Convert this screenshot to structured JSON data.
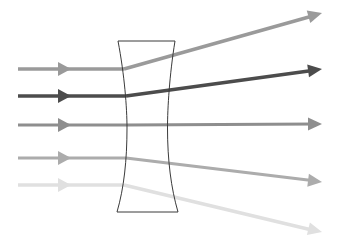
{
  "diagram": {
    "type": "optics-ray-diagram",
    "canvas": {
      "width": 339,
      "height": 251,
      "background": "#ffffff"
    },
    "lens": {
      "name": "biconcave-diverging-lens",
      "stroke_color": "#3a3a3a",
      "stroke_width": 1,
      "fill": "none",
      "top_y": 41,
      "bottom_y": 212,
      "left_top_x": 118,
      "left_waist_x": 127,
      "left_bottom_x": 117,
      "right_top_x": 175,
      "right_waist_x": 167,
      "right_bottom_x": 178,
      "path": "M118,41 L175,41 C169,96 168,150 178,212 L117,212 C127,150 126,96 118,41 Z"
    },
    "rays": [
      {
        "id": "ray-1",
        "label": "Ray 1 (upper marginal)",
        "color": "#9a9a9a",
        "width": 3.4,
        "incoming": {
          "start_x": 18,
          "start_y": 69,
          "end_x": 124,
          "end_y": 69
        },
        "outgoing": {
          "start_x": 124,
          "start_y": 69,
          "end_x": 316,
          "end_y": 15
        },
        "in_arrow_x": 71,
        "in_arrow_y": 69,
        "out_arrow_x": 322,
        "out_arrow_y": 13,
        "out_arrow_angle": -15.7
      },
      {
        "id": "ray-2",
        "label": "Ray 2 (upper paraxial, emphasized)",
        "color": "#4c4c4c",
        "width": 3.6,
        "incoming": {
          "start_x": 18,
          "start_y": 96,
          "end_x": 126,
          "end_y": 96
        },
        "outgoing": {
          "start_x": 126,
          "start_y": 96,
          "end_x": 316,
          "end_y": 70
        },
        "in_arrow_x": 71,
        "in_arrow_y": 96,
        "out_arrow_x": 322,
        "out_arrow_y": 69,
        "out_arrow_angle": -7.8
      },
      {
        "id": "ray-3",
        "label": "Ray 3 (optical axis, undeviated)",
        "color": "#8e8e8e",
        "width": 3.0,
        "incoming": {
          "start_x": 18,
          "start_y": 125,
          "end_x": 127,
          "end_y": 125
        },
        "outgoing": {
          "start_x": 127,
          "start_y": 125,
          "end_x": 316,
          "end_y": 124
        },
        "in_arrow_x": 71,
        "in_arrow_y": 125,
        "out_arrow_x": 322,
        "out_arrow_y": 124,
        "out_arrow_angle": 0
      },
      {
        "id": "ray-4",
        "label": "Ray 4 (lower paraxial)",
        "color": "#acacac",
        "width": 3.2,
        "incoming": {
          "start_x": 18,
          "start_y": 158,
          "end_x": 126,
          "end_y": 158
        },
        "outgoing": {
          "start_x": 126,
          "start_y": 158,
          "end_x": 316,
          "end_y": 181
        },
        "in_arrow_x": 71,
        "in_arrow_y": 158,
        "out_arrow_x": 322,
        "out_arrow_y": 182,
        "out_arrow_angle": 7.0
      },
      {
        "id": "ray-5",
        "label": "Ray 5 (lower marginal, faint)",
        "color": "#e0e0e0",
        "width": 3.4,
        "incoming": {
          "start_x": 18,
          "start_y": 185,
          "end_x": 124,
          "end_y": 185
        },
        "outgoing": {
          "start_x": 124,
          "start_y": 185,
          "end_x": 316,
          "end_y": 231
        },
        "in_arrow_x": 71,
        "in_arrow_y": 185,
        "out_arrow_x": 322,
        "out_arrow_y": 232,
        "out_arrow_angle": 13.5
      }
    ]
  }
}
